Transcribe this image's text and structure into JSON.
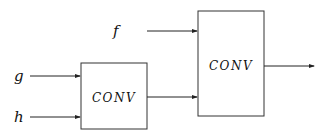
{
  "diagram": {
    "type": "block-diagram",
    "inputs": [
      {
        "id": "f",
        "label": "f"
      },
      {
        "id": "g",
        "label": "g"
      },
      {
        "id": "h",
        "label": "h"
      }
    ],
    "blocks": [
      {
        "id": "conv1",
        "label": "CONV",
        "inputs": [
          "g",
          "h"
        ]
      },
      {
        "id": "conv2",
        "label": "CONV",
        "inputs": [
          "f",
          "conv1"
        ]
      }
    ],
    "output": {
      "from": "conv2",
      "label": ""
    },
    "colors": {
      "stroke": "#222222",
      "background": "#ffffff"
    }
  }
}
